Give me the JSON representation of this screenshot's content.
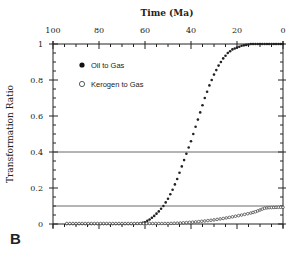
{
  "panel_label": "B",
  "chart_data": {
    "type": "scatter",
    "title": "",
    "xlabel": "Time (Ma)",
    "ylabel": "Transformation Ratio",
    "xlim": [
      100,
      0
    ],
    "ylim": [
      0,
      1
    ],
    "x_ticks": [
      100,
      80,
      60,
      40,
      20,
      0
    ],
    "y_ticks": [
      0,
      0.2,
      0.4,
      0.6,
      0.8,
      1
    ],
    "x_tick_labels": [
      "100",
      "80",
      "60",
      "40",
      "20",
      "0"
    ],
    "y_tick_labels": [
      "0",
      "0.2",
      "0.4",
      "0.6",
      "0.8",
      "1"
    ],
    "grid": false,
    "reference_lines": [
      0.4,
      0.1
    ],
    "legend": {
      "position": "upper-left",
      "entries": [
        {
          "label": "Oil to Gas",
          "marker": "filled-circle"
        },
        {
          "label": "Kerogen to Gas",
          "marker": "open-circle"
        }
      ]
    },
    "series": [
      {
        "name": "Oil to Gas",
        "marker": "filled",
        "x": [
          94,
          90,
          86,
          82,
          78,
          74,
          70,
          66,
          62,
          60,
          58,
          56,
          54,
          52,
          50,
          48,
          46,
          44,
          42,
          40,
          38,
          36,
          34,
          32,
          30,
          28,
          26,
          24,
          22,
          20,
          18,
          16,
          14,
          12,
          10,
          8,
          6,
          4,
          2,
          0
        ],
        "y": [
          0,
          0,
          0,
          0,
          0,
          0,
          0,
          0,
          0.003,
          0.01,
          0.025,
          0.045,
          0.07,
          0.1,
          0.14,
          0.19,
          0.25,
          0.32,
          0.39,
          0.46,
          0.54,
          0.62,
          0.7,
          0.77,
          0.83,
          0.88,
          0.92,
          0.95,
          0.97,
          0.98,
          0.99,
          0.995,
          1,
          1,
          1,
          1,
          1,
          1,
          1,
          1
        ]
      },
      {
        "name": "Kerogen to Gas",
        "marker": "open",
        "x": [
          94,
          90,
          86,
          82,
          78,
          74,
          70,
          66,
          62,
          58,
          54,
          50,
          46,
          42,
          38,
          34,
          30,
          26,
          22,
          18,
          14,
          12,
          10,
          8,
          6,
          4,
          2,
          0
        ],
        "y": [
          0,
          0,
          0,
          0,
          0,
          0,
          0,
          0,
          0,
          0,
          0,
          0,
          0.002,
          0.005,
          0.009,
          0.014,
          0.02,
          0.028,
          0.037,
          0.047,
          0.058,
          0.065,
          0.075,
          0.085,
          0.088,
          0.089,
          0.09,
          0.09
        ]
      }
    ]
  }
}
